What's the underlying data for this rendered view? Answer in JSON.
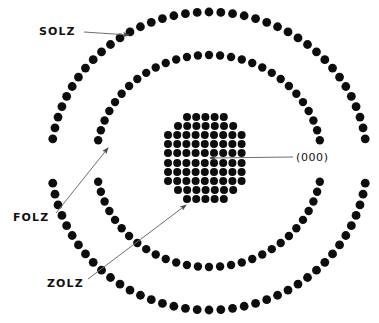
{
  "figure": {
    "background_color": "#ffffff",
    "spot_color": "#0d0d0d",
    "leader_color": "#6e6e6e",
    "width": 379,
    "height": 323
  },
  "labels": {
    "solz": "SOLZ",
    "folz": "FOLZ",
    "zolz": "ZOLZ",
    "origin": "(000)"
  },
  "chart_data": {
    "type": "scatter",
    "xlabel": "",
    "ylabel": "",
    "grid": false,
    "legend": "none",
    "xlim": [
      0,
      379
    ],
    "ylim": [
      0,
      323
    ],
    "annotations": [
      {
        "text": "SOLZ",
        "label_x": 39,
        "label_y": 32,
        "arrow_from": [
          84,
          32
        ],
        "arrow_to": [
          129,
          35
        ],
        "points_to": "second-order-laue-zone-ring"
      },
      {
        "text": "FOLZ",
        "label_x": 13,
        "label_y": 218,
        "arrow_from": [
          56,
          213
        ],
        "arrow_to": [
          108,
          148
        ],
        "points_to": "first-order-laue-zone-ring"
      },
      {
        "text": "ZOLZ",
        "label_x": 47,
        "label_y": 284,
        "arrow_from": [
          88,
          279
        ],
        "arrow_to": [
          186,
          205
        ],
        "points_to": "zero-order-laue-zone-disk"
      },
      {
        "text": "(000)",
        "label_x": 296,
        "label_y": 158,
        "arrow_from": [
          293,
          157
        ],
        "arrow_to": [
          210,
          158
        ],
        "points_to": "central-000-spot"
      }
    ],
    "series": [
      {
        "name": "ZOLZ",
        "description": "Zero order Laue zone — dense square grid of diffraction spots forming the central disk",
        "spot_radius": 4.0,
        "center": [
          209,
          158
        ],
        "lattice_spacing": 9.2,
        "rows": [
          {
            "y": 117,
            "count": 5,
            "x_start": 187,
            "dx": 9.2
          },
          {
            "y": 126,
            "count": 7,
            "x_start": 178,
            "dx": 9.2
          },
          {
            "y": 135,
            "count": 9,
            "x_start": 168,
            "dx": 9.2
          },
          {
            "y": 144,
            "count": 9,
            "x_start": 168,
            "dx": 9.2
          },
          {
            "y": 153,
            "count": 9,
            "x_start": 168,
            "dx": 9.2
          },
          {
            "y": 163,
            "count": 9,
            "x_start": 168,
            "dx": 9.2
          },
          {
            "y": 172,
            "count": 9,
            "x_start": 168,
            "dx": 9.2
          },
          {
            "y": 181,
            "count": 9,
            "x_start": 168,
            "dx": 9.2
          },
          {
            "y": 190,
            "count": 7,
            "x_start": 178,
            "dx": 9.2
          },
          {
            "y": 199,
            "count": 5,
            "x_start": 187,
            "dx": 9.2
          }
        ]
      },
      {
        "name": "FOLZ",
        "description": "First order Laue zone — ring of diffraction spots at intermediate radius with gaps",
        "spot_radius": 4.2,
        "center": [
          209,
          161
        ],
        "radius_x": 113,
        "radius_y": 106,
        "gap_arcs_deg": [
          [
            82,
            98
          ],
          [
            262,
            278
          ]
        ],
        "spot_count": 64
      },
      {
        "name": "SOLZ",
        "description": "Second order Laue zone — outermost ring of diffraction spots with gaps",
        "spot_radius": 4.4,
        "center": [
          209,
          161
        ],
        "radius_x": 158,
        "radius_y": 149,
        "gap_arcs_deg": [
          [
            84,
            96
          ],
          [
            264,
            276
          ]
        ],
        "spot_count": 84
      }
    ]
  }
}
